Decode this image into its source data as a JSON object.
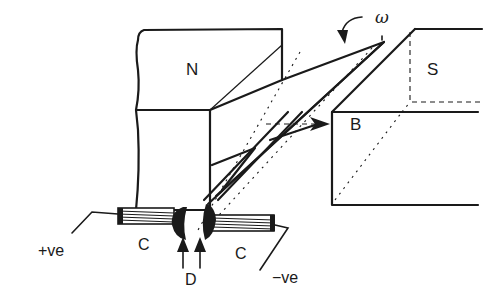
{
  "figure": {
    "labels": {
      "north_pole": "N",
      "south_pole": "S",
      "field": "B",
      "angular_velocity": "ω",
      "brush_left": "C",
      "brush_right": "C",
      "commutator": "D",
      "positive_terminal": "+ve",
      "negative_terminal": "−ve"
    },
    "colors": {
      "ink": "#1a1a1a",
      "background": "#ffffff"
    }
  }
}
